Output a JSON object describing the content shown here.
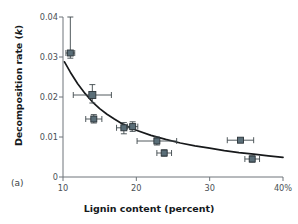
{
  "figure": {
    "panel_tag": "(a)",
    "background_color": "#ffffff",
    "marker_color": "#5a6e78",
    "marker_edge_color": "#2b3338",
    "curve_color": "#17191b",
    "axis_color": "#6e757a",
    "text_color": "#15191c"
  },
  "chart_data": {
    "type": "scatter",
    "title": "",
    "xlabel": "Lignin content (percent)",
    "ylabel": "Decomposition rate (k)",
    "xlim": [
      10,
      40
    ],
    "ylim": [
      0,
      0.04
    ],
    "grid": false,
    "legend": null,
    "xticks": [
      10,
      20,
      30,
      40
    ],
    "xtick_labels": [
      "10",
      "20",
      "30",
      "40%"
    ],
    "yticks": [
      0,
      0.01,
      0.02,
      0.03,
      0.04
    ],
    "ytick_labels": [
      "0",
      "0.01",
      "0.02",
      "0.03",
      "0.04"
    ],
    "points": [
      {
        "x": 11.0,
        "y": 0.031,
        "xerr": 0.6,
        "yerr_low": 0.0013,
        "yerr_high": 0.009
      },
      {
        "x": 14.0,
        "y": 0.0205,
        "xerr": 2.6,
        "yerr_low": 0.002,
        "yerr_high": 0.0026
      },
      {
        "x": 14.2,
        "y": 0.0145,
        "xerr": 1.1,
        "yerr_low": 0.001,
        "yerr_high": 0.0011
      },
      {
        "x": 18.3,
        "y": 0.0123,
        "xerr": 1.0,
        "yerr_low": 0.0015,
        "yerr_high": 0.0013
      },
      {
        "x": 19.5,
        "y": 0.0126,
        "xerr": 0.7,
        "yerr_low": 0.0012,
        "yerr_high": 0.0012
      },
      {
        "x": 22.8,
        "y": 0.009,
        "xerr": 2.7,
        "yerr_low": 0.001,
        "yerr_high": 0.001
      },
      {
        "x": 23.8,
        "y": 0.006,
        "xerr": 1.0,
        "yerr_low": 0.0008,
        "yerr_high": 0.0008
      },
      {
        "x": 34.2,
        "y": 0.0092,
        "xerr": 1.8,
        "yerr_low": 0.0004,
        "yerr_high": 0.0004
      },
      {
        "x": 35.8,
        "y": 0.0045,
        "xerr": 1.0,
        "yerr_low": 0.0008,
        "yerr_high": 0.0008
      }
    ],
    "fit_curve": {
      "description": "decreasing power/exponential fit",
      "x": [
        10.2,
        11,
        12,
        13,
        14,
        15,
        16,
        17,
        18,
        19,
        20,
        22,
        24,
        26,
        28,
        30,
        32,
        34,
        36,
        38,
        40
      ],
      "y": [
        0.0288,
        0.0262,
        0.0233,
        0.0209,
        0.0188,
        0.0171,
        0.0157,
        0.0145,
        0.0134,
        0.0125,
        0.0117,
        0.0104,
        0.0094,
        0.0085,
        0.0078,
        0.0072,
        0.0066,
        0.0061,
        0.0057,
        0.0053,
        0.0049
      ]
    }
  }
}
